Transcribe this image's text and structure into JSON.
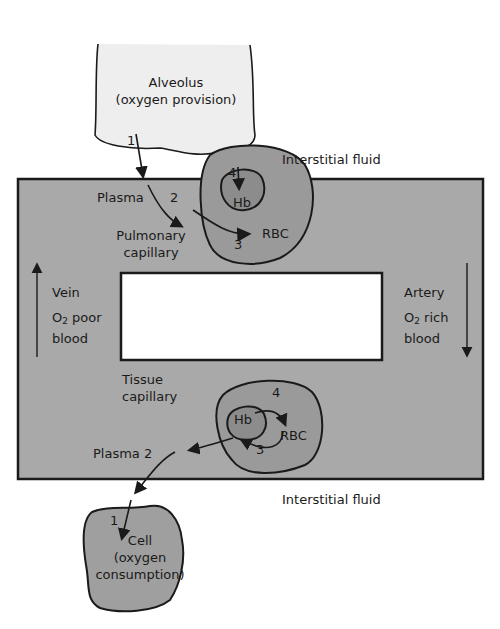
{
  "diagram": {
    "colors": {
      "blood_vessel_fill": "#a9a9a9",
      "alveolus_fill": "#eeeeee",
      "rbc_fill": "#9a9a9a",
      "hb_fill": "#8c8c8c",
      "cell_fill": "#9f9f9f",
      "outline": "#1a1a1a",
      "background": "#ffffff"
    },
    "alveolus": {
      "line1": "Alveolus",
      "line2": "(oxygen provision)"
    },
    "interstitial_top": "Interstitial fluid",
    "interstitial_bottom": "Interstitial fluid",
    "pulmonary": {
      "plasma": "Plasma",
      "step1": "1",
      "step2": "2",
      "step3": "3",
      "step4": "4",
      "hb": "Hb",
      "rbc": "RBC",
      "capillary_line1": "Pulmonary",
      "capillary_line2": "capillary"
    },
    "vein": {
      "label": "Vein",
      "o2": "O",
      "o2_sub": "2",
      "o2_rest": " poor",
      "line2": "blood",
      "arrow": "up"
    },
    "artery": {
      "label": "Artery",
      "o2": "O",
      "o2_sub": "2",
      "o2_rest": " rich",
      "line2": "blood",
      "arrow": "down"
    },
    "tissue": {
      "capillary_line1": "Tissue",
      "capillary_line2": "capillary",
      "hb": "Hb",
      "rbc": "RBC",
      "step3": "3",
      "step4": "4",
      "plasma": "Plasma 2",
      "step1": "1"
    },
    "cell": {
      "line1": "Cell",
      "line2": "(oxygen",
      "line3": "consumption)"
    }
  }
}
